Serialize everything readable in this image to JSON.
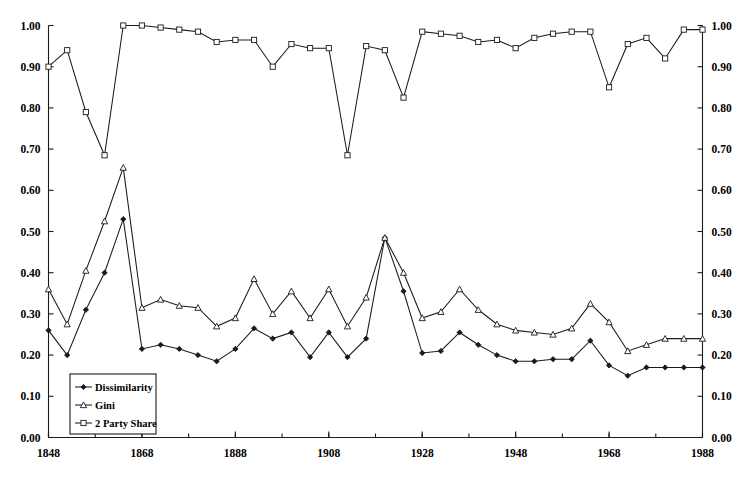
{
  "chart_data": {
    "type": "line",
    "title": "",
    "subtitle": "",
    "xlabel": "",
    "ylabel": "",
    "ylabel_right": "",
    "xlim": [
      1848,
      1988
    ],
    "ylim": [
      0.0,
      1.0
    ],
    "grid": false,
    "legend_position": "bottom-left",
    "x_major_ticks": [
      1848,
      1868,
      1888,
      1908,
      1928,
      1948,
      1968,
      1988
    ],
    "x_major_tick_labels": [
      "1848",
      "1868",
      "1888",
      "1908",
      "1928",
      "1948",
      "1968",
      "1988"
    ],
    "x_minor_tick_interval": 10,
    "y_ticks": [
      0.0,
      0.1,
      0.2,
      0.3,
      0.4,
      0.5,
      0.6,
      0.7,
      0.8,
      0.9,
      1.0
    ],
    "y_tick_labels": [
      "0.00",
      "0.10",
      "0.20",
      "0.30",
      "0.40",
      "0.50",
      "0.60",
      "0.70",
      "0.80",
      "0.90",
      "1.00"
    ],
    "y_tick_labels_right": [
      "0.00",
      "0.10",
      "0.20",
      "0.30",
      "0.40",
      "0.50",
      "0.60",
      "0.70",
      "0.80",
      "0.90",
      "1.00"
    ],
    "x": [
      1848,
      1852,
      1856,
      1860,
      1864,
      1868,
      1872,
      1876,
      1880,
      1884,
      1888,
      1892,
      1896,
      1900,
      1904,
      1908,
      1912,
      1916,
      1920,
      1924,
      1928,
      1932,
      1936,
      1940,
      1944,
      1948,
      1952,
      1956,
      1960,
      1964,
      1968,
      1972,
      1976,
      1980,
      1984,
      1988
    ],
    "series": [
      {
        "name": "Dissimilarity",
        "marker": "filled-diamond",
        "values": [
          0.26,
          0.2,
          0.31,
          0.4,
          0.53,
          0.215,
          0.225,
          0.215,
          0.2,
          0.185,
          0.215,
          0.265,
          0.24,
          0.255,
          0.195,
          0.255,
          0.195,
          0.24,
          0.485,
          0.355,
          0.205,
          0.21,
          0.255,
          0.225,
          0.2,
          0.185,
          0.185,
          0.19,
          0.19,
          0.235,
          0.175,
          0.15,
          0.17,
          0.17,
          0.17,
          0.17
        ]
      },
      {
        "name": "Gini",
        "marker": "open-triangle",
        "values": [
          0.36,
          0.275,
          0.405,
          0.525,
          0.655,
          0.315,
          0.335,
          0.32,
          0.315,
          0.27,
          0.29,
          0.385,
          0.3,
          0.355,
          0.29,
          0.36,
          0.27,
          0.34,
          0.485,
          0.4,
          0.29,
          0.305,
          0.36,
          0.31,
          0.275,
          0.26,
          0.255,
          0.25,
          0.265,
          0.325,
          0.28,
          0.21,
          0.225,
          0.24,
          0.24,
          0.24
        ]
      },
      {
        "name": "2 Party Share",
        "marker": "open-square",
        "values": [
          0.9,
          0.94,
          0.79,
          0.685,
          1.0,
          1.0,
          0.995,
          0.99,
          0.985,
          0.96,
          0.965,
          0.965,
          0.9,
          0.955,
          0.945,
          0.945,
          0.685,
          0.95,
          0.94,
          0.825,
          0.985,
          0.98,
          0.975,
          0.96,
          0.965,
          0.945,
          0.97,
          0.98,
          0.985,
          0.985,
          0.85,
          0.955,
          0.97,
          0.92,
          0.99,
          0.99
        ]
      }
    ],
    "legend": [
      {
        "label": "Dissimilarity",
        "marker": "filled-diamond"
      },
      {
        "label": "Gini",
        "marker": "open-triangle"
      },
      {
        "label": "2 Party Share",
        "marker": "open-square"
      }
    ],
    "colors": {
      "axis": "#1a1a1a",
      "series": "#1a1a1a",
      "background": "#ffffff"
    }
  }
}
